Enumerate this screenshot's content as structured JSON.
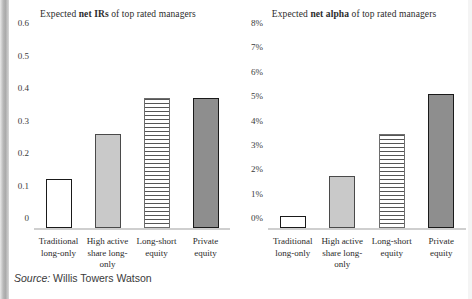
{
  "source": {
    "label": "Source:",
    "name": "Willis Towers Watson"
  },
  "colors": {
    "outline": "#1a1a1a",
    "light_fill": "#c9c9c9",
    "dark_fill": "#8e8e8e",
    "baseline": "#cfcfcf",
    "text": "#2b2b2b"
  },
  "charts": [
    {
      "id": "net-irs",
      "title_prefix": "Expected ",
      "title_bold": "net IRs",
      "title_suffix": " of top rated managers",
      "title_full": "Expected net IRs of top rated managers"
    },
    {
      "id": "net-alpha",
      "title_prefix": "Expected ",
      "title_bold": "net alpha",
      "title_suffix": " of top rated managers",
      "title_full": "Expected net alpha of top rated managers"
    }
  ],
  "chart_data": [
    {
      "type": "bar",
      "id": "net-irs",
      "title": "Expected net IRs of top rated managers",
      "xlabel": "",
      "ylabel": "",
      "ylim": [
        0,
        0.6
      ],
      "yticks": [
        0,
        0.1,
        0.2,
        0.3,
        0.4,
        0.5,
        0.6
      ],
      "ytick_labels": [
        "0",
        "0.1",
        "0.2",
        "0.3",
        "0.4",
        "0.5",
        "0.6"
      ],
      "grid": false,
      "legend": "none",
      "categories": [
        "Traditional long-only",
        "High active share long-only",
        "Long-short equity",
        "Private equity"
      ],
      "category_lines": [
        [
          "Traditional",
          "long-only"
        ],
        [
          "High active",
          "share long-",
          "only"
        ],
        [
          "Long-short",
          "equity"
        ],
        [
          "Private",
          "equity"
        ]
      ],
      "values": [
        0.15,
        0.29,
        0.4,
        0.4
      ],
      "fills": [
        "none",
        "light",
        "hstripe",
        "dark"
      ]
    },
    {
      "type": "bar",
      "id": "net-alpha",
      "title": "Expected net alpha of top rated managers",
      "xlabel": "",
      "ylabel": "",
      "ylim": [
        0,
        8
      ],
      "yticks": [
        0,
        1,
        2,
        3,
        4,
        5,
        6,
        7,
        8
      ],
      "ytick_labels": [
        "0%",
        "1%",
        "2%",
        "3%",
        "4%",
        "5%",
        "6%",
        "7%",
        "8%"
      ],
      "grid": false,
      "legend": "none",
      "categories": [
        "Traditional long-only",
        "High active share long-only",
        "Long-short equity",
        "Private equity"
      ],
      "category_lines": [
        [
          "Traditional",
          "long-only"
        ],
        [
          "High active",
          "share long-",
          "only"
        ],
        [
          "Long-short",
          "equity"
        ],
        [
          "Private",
          "equity"
        ]
      ],
      "values": [
        0.5,
        2.15,
        3.85,
        5.5
      ],
      "fills": [
        "none",
        "light",
        "hstripe",
        "dark"
      ]
    }
  ]
}
